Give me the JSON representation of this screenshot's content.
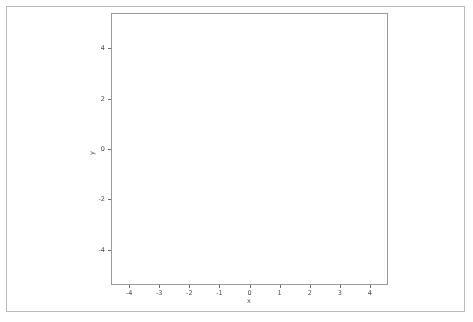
{
  "figure": {
    "background_color": "#ffffff",
    "frame_color": "#b9b9b9",
    "axes_color": "#9a9a9a"
  },
  "axes": {
    "xlabel": "x",
    "ylabel": "y",
    "xticks": [
      "-4",
      "-3",
      "-2",
      "-1",
      "0",
      "1",
      "2",
      "3",
      "4"
    ],
    "yticks": [
      "4",
      "2",
      "0",
      "-2",
      "-4"
    ]
  },
  "chart_data": {
    "type": "scatter",
    "title": "",
    "xlabel": "x",
    "ylabel": "y",
    "xlim": [
      -4.6,
      4.6
    ],
    "ylim": [
      -5.4,
      5.4
    ],
    "xticks": [
      -4,
      -3,
      -2,
      -1,
      0,
      1,
      2,
      3,
      4
    ],
    "yticks": [
      4,
      2,
      0,
      -2,
      -4
    ],
    "grid": false,
    "legend": null,
    "overlay": "kde-contours",
    "point_color": "#6b6b6b",
    "point_size": 0.9,
    "point_count": 5000,
    "contour_color": "#1a1a1a",
    "contour_line_width": 1.1,
    "contour_levels": 5,
    "series": [
      {
        "name": "bivariate-normal-sample",
        "distribution": "gaussian",
        "mean_x": 0.0,
        "mean_y": 0.2,
        "std_x": 1.15,
        "std_y": 1.3,
        "correlation": 0.52,
        "n": 5000
      }
    ],
    "contours": [
      {
        "level": 1,
        "label": "innermost",
        "radius_scale": 0.55
      },
      {
        "level": 2,
        "label": "inner",
        "radius_scale": 0.95
      },
      {
        "level": 3,
        "label": "middle",
        "radius_scale": 1.35
      },
      {
        "level": 4,
        "label": "outer",
        "radius_scale": 1.8
      },
      {
        "level": 5,
        "label": "outermost",
        "radius_scale": 2.35
      }
    ]
  }
}
